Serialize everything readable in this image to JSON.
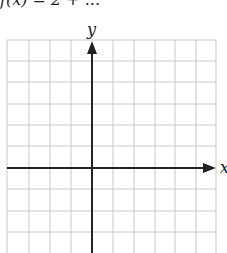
{
  "title": "f(x) = 2 + ...",
  "axes": {
    "x_label": "x",
    "y_label": "y"
  },
  "grid": {
    "columns": 10,
    "rows": 10,
    "cell_size_px": 21,
    "line_color": "#c8c8c8",
    "axis_color": "#222222"
  }
}
